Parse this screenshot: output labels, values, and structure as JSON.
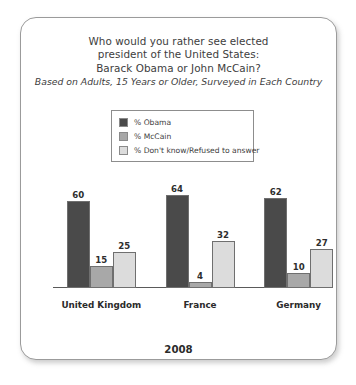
{
  "card": {
    "title_lines": [
      "Who would you rather see elected",
      "president of the United States:",
      "Barack Obama or John McCain?"
    ],
    "subtitle": "Based on Adults, 15 Years or Older, Surveyed in Each Country",
    "footer_year": "2008"
  },
  "legend": {
    "items": [
      {
        "label": "% Obama",
        "color": "#4a4a4a"
      },
      {
        "label": "% McCain",
        "color": "#a8a8a8"
      },
      {
        "label": "% Don't know/Refused to answer",
        "color": "#dcdcdc"
      }
    ]
  },
  "chart_data": {
    "type": "bar",
    "title": "Who would you rather see elected president of the United States: Barack Obama or John McCain?",
    "subtitle": "Based on Adults, 15 Years or Older, Surveyed in Each Country",
    "xlabel": "2008",
    "ylabel": "",
    "ylim": [
      0,
      70
    ],
    "grid": false,
    "legend_position": "top-center",
    "categories": [
      "United Kingdom",
      "France",
      "Germany"
    ],
    "series": [
      {
        "name": "% Obama",
        "color": "#4a4a4a",
        "values": [
          60,
          64,
          62
        ]
      },
      {
        "name": "% McCain",
        "color": "#a8a8a8",
        "values": [
          15,
          4,
          10
        ]
      },
      {
        "name": "% Don't know/Refused to answer",
        "color": "#dcdcdc",
        "values": [
          25,
          32,
          27
        ]
      }
    ]
  }
}
